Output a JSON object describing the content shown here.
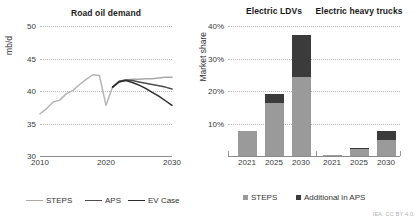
{
  "credit": "IEA. CC BY 4.0.",
  "left": {
    "title": "Road oil demand",
    "ylabel": "mb/d",
    "yticks": [
      "30",
      "35",
      "40",
      "45",
      "50"
    ],
    "xticks": [
      "2010",
      "2020",
      "2030"
    ],
    "legend": [
      {
        "label": "STEPS",
        "color": "#a8a8a8"
      },
      {
        "label": "APS",
        "color": "#4d4d4d"
      },
      {
        "label": "EV Case",
        "color": "#2b2b2b"
      }
    ]
  },
  "right": {
    "ylabel": "Market share",
    "yticks": [
      "10%",
      "20%",
      "30%",
      "40%"
    ],
    "groups": [
      {
        "title": "Electric LDVs",
        "xticks": [
          "2021",
          "2025",
          "2030"
        ]
      },
      {
        "title": "Electric heavy trucks",
        "xticks": [
          "2021",
          "2025",
          "2030"
        ]
      }
    ],
    "legend": [
      {
        "label": "STEPS",
        "color": "#9a9a9a"
      },
      {
        "label": "Additional in APS",
        "color": "#3b3b3b"
      }
    ]
  },
  "chart_data": [
    {
      "type": "line",
      "title": "Road oil demand",
      "xlabel": "",
      "ylabel": "mb/d",
      "xlim": [
        2010,
        2030
      ],
      "ylim": [
        30,
        50
      ],
      "yticks": [
        30,
        35,
        40,
        45,
        50
      ],
      "xticks": [
        2010,
        2020,
        2030
      ],
      "grid": true,
      "legend_position": "bottom",
      "series": [
        {
          "name": "Historical",
          "color": "#b5b5b5",
          "x": [
            2010,
            2011,
            2012,
            2013,
            2014,
            2015,
            2016,
            2017,
            2018,
            2019,
            2020,
            2021
          ],
          "values": [
            36.5,
            37.3,
            38.3,
            38.6,
            39.6,
            40.1,
            41.0,
            41.8,
            42.5,
            42.4,
            37.8,
            40.6
          ]
        },
        {
          "name": "STEPS",
          "color": "#a8a8a8",
          "x": [
            2021,
            2022,
            2023,
            2024,
            2025,
            2026,
            2027,
            2028,
            2029,
            2030
          ],
          "values": [
            40.6,
            41.5,
            41.7,
            41.8,
            41.8,
            41.9,
            41.9,
            42.0,
            42.1,
            42.1
          ]
        },
        {
          "name": "APS",
          "color": "#4d4d4d",
          "x": [
            2021,
            2022,
            2023,
            2024,
            2025,
            2026,
            2027,
            2028,
            2029,
            2030
          ],
          "values": [
            40.6,
            41.5,
            41.7,
            41.6,
            41.4,
            41.2,
            41.0,
            40.8,
            40.6,
            40.3
          ]
        },
        {
          "name": "EV Case",
          "color": "#2b2b2b",
          "x": [
            2021,
            2022,
            2023,
            2024,
            2025,
            2026,
            2027,
            2028,
            2029,
            2030
          ],
          "values": [
            40.6,
            41.4,
            41.6,
            41.3,
            40.9,
            40.4,
            39.8,
            39.2,
            38.5,
            37.8
          ]
        }
      ]
    },
    {
      "type": "bar",
      "title": "",
      "xlabel": "",
      "ylabel": "Market share",
      "ylim": [
        0,
        40
      ],
      "yticks": [
        10,
        20,
        30,
        40
      ],
      "stacked": true,
      "grid": true,
      "legend_position": "bottom",
      "groups": [
        "Electric LDVs",
        "Electric heavy trucks"
      ],
      "categories": [
        "2021",
        "2025",
        "2030",
        "2021",
        "2025",
        "2030"
      ],
      "series": [
        {
          "name": "STEPS",
          "color": "#9a9a9a",
          "values": [
            7.6,
            16.4,
            24.4,
            0.3,
            2.5,
            4.8
          ]
        },
        {
          "name": "Additional in APS",
          "color": "#3b3b3b",
          "values": [
            0.0,
            2.7,
            12.8,
            0.0,
            0.1,
            2.8
          ]
        }
      ]
    }
  ]
}
